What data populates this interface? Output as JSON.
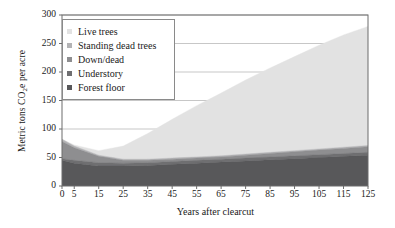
{
  "chart_data": {
    "type": "area",
    "stacked": true,
    "title": "",
    "xlabel": "Years after clearcut",
    "ylabel": "Metric tons CO2e per acre",
    "ylabel_parts": {
      "pre": "Metric tons CO",
      "sub": "2",
      "post": "e per acre"
    },
    "x": [
      0,
      5,
      15,
      25,
      35,
      45,
      55,
      65,
      75,
      85,
      95,
      105,
      115,
      125
    ],
    "xticks": [
      "0",
      "5",
      "15",
      "25",
      "35",
      "45",
      "55",
      "65",
      "75",
      "85",
      "95",
      "105",
      "115",
      "125"
    ],
    "yticks": [
      "0",
      "50",
      "100",
      "150",
      "200",
      "250",
      "300"
    ],
    "xlim": [
      0,
      125
    ],
    "ylim": [
      0,
      300
    ],
    "grid": "horizontal",
    "legend_position": "top-left-inside",
    "series": [
      {
        "name": "Forest floor",
        "color": "#58585a",
        "values": [
          45,
          40,
          35,
          35,
          36,
          38,
          40,
          42,
          44,
          46,
          48,
          50,
          52,
          54
        ]
      },
      {
        "name": "Understory",
        "color": "#6f6f71",
        "values": [
          3,
          5,
          6,
          5,
          5,
          5,
          5,
          5,
          5,
          5,
          5,
          5,
          5,
          5
        ]
      },
      {
        "name": "Down/dead",
        "color": "#8e8e90",
        "values": [
          30,
          22,
          11,
          5,
          4,
          4,
          4,
          4,
          5,
          6,
          7,
          8,
          9,
          10
        ]
      },
      {
        "name": "Standing dead trees",
        "color": "#b3b3b5",
        "values": [
          4,
          3,
          2,
          2,
          2,
          2,
          2,
          2,
          2,
          2,
          2,
          2,
          2,
          2
        ]
      },
      {
        "name": "Live trees",
        "color": "#e2e2e2",
        "values": [
          0,
          2,
          8,
          23,
          45,
          68,
          90,
          110,
          130,
          148,
          165,
          182,
          197,
          209
        ]
      }
    ],
    "stack_totals": [
      82,
      72,
      62,
      70,
      92,
      117,
      141,
      163,
      186,
      207,
      227,
      247,
      265,
      280
    ]
  },
  "legend": {
    "items": [
      {
        "label": "Live trees",
        "color": "#e2e2e2"
      },
      {
        "label": "Standing dead trees",
        "color": "#b3b3b5"
      },
      {
        "label": "Down/dead",
        "color": "#8e8e90"
      },
      {
        "label": "Understory",
        "color": "#6f6f71"
      },
      {
        "label": "Forest floor",
        "color": "#58585a"
      }
    ]
  },
  "axes": {
    "frame_color": "#6d6d6d",
    "grid_color": "#b9b9b9"
  }
}
